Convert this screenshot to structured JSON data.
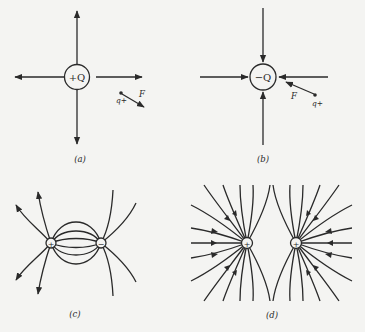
{
  "figure": {
    "background": "#f4f4f2",
    "ink": "#2a2a2a",
    "panels": [
      {
        "id": "a",
        "caption": "(a)",
        "charge_label": "+Q",
        "test_charge_label": "q+",
        "force_label": "F",
        "field_direction": "outward"
      },
      {
        "id": "b",
        "caption": "(b)",
        "charge_label": "−Q",
        "test_charge_label": "q+",
        "force_label": "F",
        "field_direction": "inward"
      },
      {
        "id": "c",
        "caption": "(c)",
        "charge_left": "+",
        "charge_right": "−",
        "description": "dipole field lines"
      },
      {
        "id": "d",
        "caption": "(d)",
        "charge_left": "+",
        "charge_right": "+",
        "description": "two like charges field lines"
      }
    ]
  }
}
